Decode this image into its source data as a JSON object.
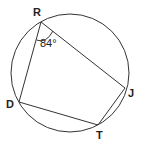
{
  "diagram": {
    "type": "inscribed quadrilateral in circle",
    "colors": {
      "stroke": "#333333",
      "text": "#222222",
      "background": "#ffffff"
    },
    "circle": {
      "cx": 70,
      "cy": 73,
      "r": 59
    },
    "vertices": [
      {
        "name": "R",
        "x": 41,
        "y": 22,
        "label_x": 33,
        "label_y": 16
      },
      {
        "name": "J",
        "x": 125,
        "y": 88,
        "label_x": 128,
        "label_y": 97
      },
      {
        "name": "T",
        "x": 98,
        "y": 125,
        "label_x": 96,
        "label_y": 139
      },
      {
        "name": "D",
        "x": 19,
        "y": 102,
        "label_x": 6,
        "label_y": 108
      }
    ],
    "angle": {
      "vertex": "R",
      "value": "84°",
      "label_x": 40,
      "label_y": 47
    }
  }
}
